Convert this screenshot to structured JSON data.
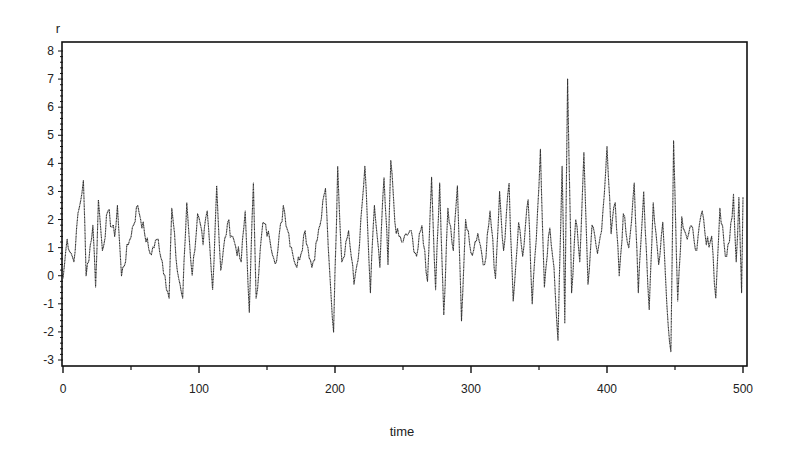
{
  "chart_data": {
    "type": "line",
    "title": "",
    "xlabel": "time",
    "ylabel": "r",
    "xlim": [
      0,
      500
    ],
    "ylim": [
      -3,
      8
    ],
    "x_ticks": [
      0,
      100,
      200,
      300,
      400,
      500
    ],
    "x_tick_labels": [
      "0",
      "100",
      "200",
      "300",
      "400",
      "500"
    ],
    "x_minor_ticks": [
      50,
      150,
      250,
      350,
      450
    ],
    "y_ticks": [
      -3,
      -2,
      -1,
      0,
      1,
      2,
      3,
      4,
      5,
      6,
      7,
      8
    ],
    "y_tick_labels": [
      "-3",
      "-2",
      "-1",
      "0",
      "1",
      "2",
      "3",
      "4",
      "5",
      "6",
      "7",
      "8"
    ],
    "grid": false,
    "legend": null,
    "line_color": "#333333",
    "series": [
      {
        "name": "r",
        "description": "Noisy time series of about 500 observations, centered near 1, with volatility clusters. Key points estimated from the plot.",
        "key_points": [
          {
            "x": 0,
            "y": -0.1
          },
          {
            "x": 3,
            "y": 1.3
          },
          {
            "x": 8,
            "y": 0.5
          },
          {
            "x": 10,
            "y": 1.7
          },
          {
            "x": 15,
            "y": 3.4
          },
          {
            "x": 17,
            "y": 0.0
          },
          {
            "x": 22,
            "y": 1.8
          },
          {
            "x": 24,
            "y": -0.4
          },
          {
            "x": 26,
            "y": 2.7
          },
          {
            "x": 29,
            "y": 0.9
          },
          {
            "x": 33,
            "y": 2.3
          },
          {
            "x": 38,
            "y": 1.4
          },
          {
            "x": 40,
            "y": 2.5
          },
          {
            "x": 43,
            "y": 0.0
          },
          {
            "x": 48,
            "y": 1.1
          },
          {
            "x": 55,
            "y": 2.5
          },
          {
            "x": 60,
            "y": 1.5
          },
          {
            "x": 64,
            "y": 0.8
          },
          {
            "x": 70,
            "y": 1.3
          },
          {
            "x": 75,
            "y": 0.0
          },
          {
            "x": 78,
            "y": -0.8
          },
          {
            "x": 80,
            "y": 2.4
          },
          {
            "x": 84,
            "y": 0.2
          },
          {
            "x": 88,
            "y": -0.8
          },
          {
            "x": 91,
            "y": 2.6
          },
          {
            "x": 95,
            "y": 0.0
          },
          {
            "x": 99,
            "y": 2.2
          },
          {
            "x": 103,
            "y": 1.1
          },
          {
            "x": 106,
            "y": 2.3
          },
          {
            "x": 110,
            "y": -0.5
          },
          {
            "x": 113,
            "y": 3.2
          },
          {
            "x": 116,
            "y": 0.2
          },
          {
            "x": 121,
            "y": 1.9
          },
          {
            "x": 126,
            "y": 1.2
          },
          {
            "x": 131,
            "y": 0.5
          },
          {
            "x": 134,
            "y": 2.3
          },
          {
            "x": 137,
            "y": -1.3
          },
          {
            "x": 140,
            "y": 3.3
          },
          {
            "x": 142,
            "y": -0.8
          },
          {
            "x": 147,
            "y": 1.9
          },
          {
            "x": 152,
            "y": 1.3
          },
          {
            "x": 157,
            "y": 0.5
          },
          {
            "x": 162,
            "y": 2.5
          },
          {
            "x": 168,
            "y": 1.0
          },
          {
            "x": 172,
            "y": 0.3
          },
          {
            "x": 178,
            "y": 1.6
          },
          {
            "x": 183,
            "y": 0.3
          },
          {
            "x": 189,
            "y": 1.8
          },
          {
            "x": 193,
            "y": 3.1
          },
          {
            "x": 196,
            "y": 0.2
          },
          {
            "x": 199,
            "y": -2.0
          },
          {
            "x": 202,
            "y": 3.9
          },
          {
            "x": 205,
            "y": 0.5
          },
          {
            "x": 210,
            "y": 1.6
          },
          {
            "x": 214,
            "y": -0.3
          },
          {
            "x": 218,
            "y": 1.1
          },
          {
            "x": 222,
            "y": 3.9
          },
          {
            "x": 226,
            "y": -0.6
          },
          {
            "x": 229,
            "y": 2.5
          },
          {
            "x": 233,
            "y": 0.3
          },
          {
            "x": 236,
            "y": 3.5
          },
          {
            "x": 239,
            "y": 0.4
          },
          {
            "x": 241,
            "y": 4.1
          },
          {
            "x": 245,
            "y": 1.5
          },
          {
            "x": 250,
            "y": 1.2
          },
          {
            "x": 255,
            "y": 1.6
          },
          {
            "x": 260,
            "y": 0.7
          },
          {
            "x": 264,
            "y": 1.8
          },
          {
            "x": 268,
            "y": -0.2
          },
          {
            "x": 271,
            "y": 3.5
          },
          {
            "x": 274,
            "y": -0.5
          },
          {
            "x": 277,
            "y": 3.3
          },
          {
            "x": 280,
            "y": -1.4
          },
          {
            "x": 283,
            "y": 2.4
          },
          {
            "x": 287,
            "y": 0.9
          },
          {
            "x": 290,
            "y": 3.2
          },
          {
            "x": 293,
            "y": -1.6
          },
          {
            "x": 296,
            "y": 2.0
          },
          {
            "x": 300,
            "y": 0.8
          },
          {
            "x": 305,
            "y": 1.5
          },
          {
            "x": 310,
            "y": 0.4
          },
          {
            "x": 314,
            "y": 2.3
          },
          {
            "x": 318,
            "y": -0.1
          },
          {
            "x": 321,
            "y": 3.0
          },
          {
            "x": 324,
            "y": 0.9
          },
          {
            "x": 328,
            "y": 3.3
          },
          {
            "x": 331,
            "y": -0.9
          },
          {
            "x": 335,
            "y": 1.9
          },
          {
            "x": 338,
            "y": 0.7
          },
          {
            "x": 342,
            "y": 2.7
          },
          {
            "x": 345,
            "y": -1.0
          },
          {
            "x": 348,
            "y": 1.3
          },
          {
            "x": 351,
            "y": 4.5
          },
          {
            "x": 354,
            "y": -0.4
          },
          {
            "x": 358,
            "y": 1.7
          },
          {
            "x": 361,
            "y": 0.3
          },
          {
            "x": 364,
            "y": -2.3
          },
          {
            "x": 367,
            "y": 3.9
          },
          {
            "x": 369,
            "y": -1.7
          },
          {
            "x": 371,
            "y": 7.0
          },
          {
            "x": 374,
            "y": -0.6
          },
          {
            "x": 377,
            "y": 2.0
          },
          {
            "x": 380,
            "y": 0.5
          },
          {
            "x": 383,
            "y": 4.4
          },
          {
            "x": 386,
            "y": -0.3
          },
          {
            "x": 389,
            "y": 1.8
          },
          {
            "x": 393,
            "y": 0.8
          },
          {
            "x": 396,
            "y": 1.6
          },
          {
            "x": 400,
            "y": 4.6
          },
          {
            "x": 403,
            "y": 1.5
          },
          {
            "x": 406,
            "y": 2.6
          },
          {
            "x": 409,
            "y": 0.0
          },
          {
            "x": 412,
            "y": 2.2
          },
          {
            "x": 416,
            "y": 1.0
          },
          {
            "x": 420,
            "y": 3.3
          },
          {
            "x": 423,
            "y": -0.6
          },
          {
            "x": 427,
            "y": 3.0
          },
          {
            "x": 431,
            "y": -1.2
          },
          {
            "x": 434,
            "y": 2.6
          },
          {
            "x": 438,
            "y": 0.4
          },
          {
            "x": 441,
            "y": 1.9
          },
          {
            "x": 444,
            "y": -1.0
          },
          {
            "x": 447,
            "y": -2.7
          },
          {
            "x": 449,
            "y": 4.8
          },
          {
            "x": 452,
            "y": -0.9
          },
          {
            "x": 455,
            "y": 2.1
          },
          {
            "x": 459,
            "y": 1.3
          },
          {
            "x": 463,
            "y": 1.7
          },
          {
            "x": 466,
            "y": 0.9
          },
          {
            "x": 470,
            "y": 2.3
          },
          {
            "x": 473,
            "y": 1.1
          },
          {
            "x": 477,
            "y": 1.4
          },
          {
            "x": 480,
            "y": -0.8
          },
          {
            "x": 483,
            "y": 2.4
          },
          {
            "x": 487,
            "y": 0.7
          },
          {
            "x": 490,
            "y": 1.2
          },
          {
            "x": 493,
            "y": 2.9
          },
          {
            "x": 495,
            "y": 0.5
          },
          {
            "x": 497,
            "y": 2.8
          },
          {
            "x": 499,
            "y": -0.6
          },
          {
            "x": 500,
            "y": 2.8
          }
        ]
      }
    ],
    "layout": {
      "plot_left_px": 63,
      "plot_right_px": 743,
      "plot_top_px": 42,
      "plot_bottom_px": 366,
      "y_top_value_px": 51,
      "y_bottom_value_px": 360
    }
  }
}
